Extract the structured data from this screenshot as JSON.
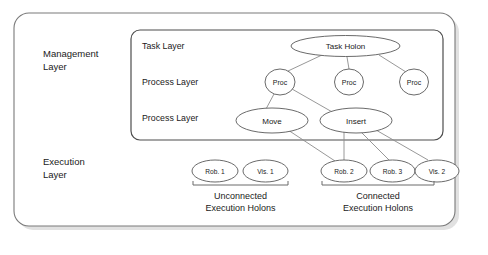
{
  "diagram": {
    "colors": {
      "outer_border": "#7a7a7a",
      "inner_border": "#4d4d4d",
      "node_stroke": "#595959",
      "edge_stroke": "#8c8c8c",
      "bracket_stroke": "#6b6b6b",
      "shadow": "#c9c9c9",
      "text": "#1a1a1a",
      "background": "#ffffff"
    },
    "layers": [
      {
        "id": "management",
        "label": "Management\nLayer"
      },
      {
        "id": "execution",
        "label": "Execution\nLayer"
      }
    ],
    "inner_box_labels": [
      {
        "id": "task-layer",
        "label": "Task Layer"
      },
      {
        "id": "process-layer-1",
        "label": "Process Layer"
      },
      {
        "id": "process-layer-2",
        "label": "Process Layer"
      }
    ],
    "nodes": [
      {
        "id": "task-holon",
        "label": "Task Holon",
        "cx": 345.5,
        "cy": 46,
        "rx": 54.5,
        "ry": 10.5,
        "size": "big"
      },
      {
        "id": "proc-1",
        "label": "Proc",
        "cx": 280,
        "cy": 82,
        "rx": 15,
        "ry": 13,
        "size": "proc"
      },
      {
        "id": "proc-2",
        "label": "Proc",
        "cx": 349,
        "cy": 82,
        "rx": 14.5,
        "ry": 13,
        "size": "proc"
      },
      {
        "id": "proc-3",
        "label": "Proc",
        "cx": 414,
        "cy": 82,
        "rx": 14.5,
        "ry": 13,
        "size": "proc"
      },
      {
        "id": "move",
        "label": "Move",
        "cx": 272,
        "cy": 120.5,
        "rx": 36,
        "ry": 12.5,
        "size": "big"
      },
      {
        "id": "insert",
        "label": "Insert",
        "cx": 356,
        "cy": 120.5,
        "rx": 36,
        "ry": 12.5,
        "size": "big"
      },
      {
        "id": "rob-1",
        "label": "Rob. 1",
        "cx": 215,
        "cy": 171,
        "rx": 23,
        "ry": 11,
        "size": "small"
      },
      {
        "id": "vis-1",
        "label": "Vis. 1",
        "cx": 265.5,
        "cy": 171,
        "rx": 22.5,
        "ry": 11,
        "size": "small"
      },
      {
        "id": "rob-2",
        "label": "Rob. 2",
        "cx": 344,
        "cy": 171,
        "rx": 23,
        "ry": 11,
        "size": "small"
      },
      {
        "id": "rob-3",
        "label": "Rob. 3",
        "cx": 392.5,
        "cy": 171,
        "rx": 22.5,
        "ry": 11,
        "size": "small"
      },
      {
        "id": "vis-2",
        "label": "Vis. 2",
        "cx": 437,
        "cy": 171,
        "rx": 22,
        "ry": 11,
        "size": "small"
      }
    ],
    "edges": [
      {
        "from": "task-holon",
        "to": "proc-1",
        "x1": 322,
        "y1": 55,
        "x2": 288,
        "y2": 71
      },
      {
        "from": "task-holon",
        "to": "proc-2",
        "x1": 347,
        "y1": 57,
        "x2": 349,
        "y2": 69
      },
      {
        "from": "task-holon",
        "to": "proc-3",
        "x1": 379,
        "y1": 55,
        "x2": 406,
        "y2": 72
      },
      {
        "from": "proc-1",
        "to": "move",
        "x1": 274,
        "y1": 94,
        "x2": 266,
        "y2": 109
      },
      {
        "from": "proc-1",
        "to": "insert",
        "x1": 292,
        "y1": 89,
        "x2": 334,
        "y2": 113
      },
      {
        "from": "move",
        "to": "rob-2",
        "x1": 288,
        "y1": 130,
        "x2": 335,
        "y2": 161
      },
      {
        "from": "insert",
        "to": "rob-2",
        "x1": 344,
        "y1": 131,
        "x2": 344,
        "y2": 160
      },
      {
        "from": "insert",
        "to": "rob-3",
        "x1": 361,
        "y1": 132,
        "x2": 389,
        "y2": 160
      },
      {
        "from": "insert",
        "to": "vis-2",
        "x1": 376,
        "y1": 130,
        "x2": 428,
        "y2": 160
      }
    ],
    "groups": [
      {
        "id": "unconnected-execution-holons",
        "caption": "Unconnected\nExecution Holons",
        "bracket": {
          "x1": 193,
          "x2": 288,
          "y": 185,
          "tick": 4
        },
        "caption_x": 240.5,
        "caption_y": 190
      },
      {
        "id": "connected-execution-holons",
        "caption": "Connected\nExecution Holons",
        "bracket": {
          "x1": 322,
          "x2": 434,
          "y": 185,
          "tick": 4
        },
        "caption_x": 378,
        "caption_y": 190
      }
    ],
    "boxes": {
      "outer": {
        "x": 14,
        "y": 13,
        "w": 441,
        "h": 213,
        "r": 15
      },
      "inner": {
        "x": 131,
        "y": 30,
        "w": 312,
        "h": 110,
        "r": 9
      }
    },
    "label_positions": {
      "management": {
        "x": 43,
        "y": 48
      },
      "execution": {
        "x": 43,
        "y": 156
      },
      "task_layer": {
        "x": 142,
        "y": 41
      },
      "process_layer_1": {
        "x": 142,
        "y": 77
      },
      "process_layer_2": {
        "x": 142,
        "y": 113
      }
    }
  }
}
